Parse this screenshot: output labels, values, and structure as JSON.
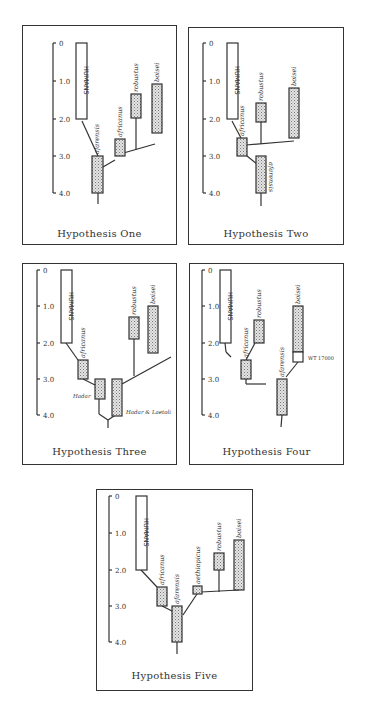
{
  "figure": {
    "axis_ticks": [
      "0",
      "1.0",
      "2.0",
      "3.0",
      "4.0"
    ],
    "axis_unit": "million years ago",
    "colors": {
      "line": "#333333",
      "fill_stipple": "#cfcfcf",
      "background": "#ffffff"
    }
  },
  "panels": [
    {
      "title": "Hypothesis One",
      "taxa": [
        {
          "label": "HUMANS",
          "start": 0,
          "end": 2.0,
          "fill": "open"
        },
        {
          "label": "afarensis",
          "start": 3.0,
          "end": 4.0,
          "fill": "stipple"
        },
        {
          "label": "africanus",
          "start": 2.6,
          "end": 3.0,
          "fill": "stipple"
        },
        {
          "label": "robustus",
          "start": 1.4,
          "end": 2.0,
          "fill": "stipple"
        },
        {
          "label": "boisei",
          "start": 1.1,
          "end": 2.4,
          "fill": "stipple"
        }
      ]
    },
    {
      "title": "Hypothesis Two",
      "taxa": [
        {
          "label": "HUMANS",
          "start": 0,
          "end": 2.0,
          "fill": "open"
        },
        {
          "label": "africanus",
          "start": 2.6,
          "end": 3.0,
          "fill": "stipple"
        },
        {
          "label": "robustus",
          "start": 1.6,
          "end": 2.1,
          "fill": "stipple"
        },
        {
          "label": "boisei",
          "start": 1.2,
          "end": 2.5,
          "fill": "stipple"
        },
        {
          "label": "afarensis",
          "start": 3.0,
          "end": 4.0,
          "fill": "stipple"
        }
      ]
    },
    {
      "title": "Hypothesis Three",
      "taxa": [
        {
          "label": "HUMANS",
          "start": 0,
          "end": 2.0,
          "fill": "open"
        },
        {
          "label": "africanus",
          "start": 2.5,
          "end": 3.0,
          "fill": "stipple"
        },
        {
          "label": "Hadar",
          "start": 3.0,
          "end": 3.5,
          "fill": "stipple"
        },
        {
          "label": "Hadar & Laetoli",
          "start": 3.0,
          "end": 4.0,
          "fill": "stipple"
        },
        {
          "label": "robustus",
          "start": 1.3,
          "end": 1.9,
          "fill": "stipple"
        },
        {
          "label": "boisei",
          "start": 1.0,
          "end": 2.3,
          "fill": "stipple"
        }
      ]
    },
    {
      "title": "Hypothesis Four",
      "taxa": [
        {
          "label": "HUMANS",
          "start": 0,
          "end": 2.0,
          "fill": "open"
        },
        {
          "label": "africanus",
          "start": 2.5,
          "end": 3.0,
          "fill": "stipple"
        },
        {
          "label": "robustus",
          "start": 1.4,
          "end": 2.0,
          "fill": "stipple"
        },
        {
          "label": "afarensis",
          "start": 3.0,
          "end": 4.0,
          "fill": "stipple"
        },
        {
          "label": "boisei",
          "start": 1.0,
          "end": 2.3,
          "fill": "stipple"
        },
        {
          "label": "WT 17000",
          "start": 2.3,
          "end": 2.6,
          "fill": "open"
        }
      ]
    },
    {
      "title": "Hypothesis Five",
      "taxa": [
        {
          "label": "HUMANS",
          "start": 0,
          "end": 2.0,
          "fill": "open"
        },
        {
          "label": "africanus",
          "start": 2.5,
          "end": 3.0,
          "fill": "stipple"
        },
        {
          "label": "afarensis",
          "start": 3.0,
          "end": 4.0,
          "fill": "stipple"
        },
        {
          "label": "aethiopicus",
          "start": 2.4,
          "end": 2.6,
          "fill": "stipple"
        },
        {
          "label": "robustus",
          "start": 1.5,
          "end": 2.0,
          "fill": "stipple"
        },
        {
          "label": "boisei",
          "start": 1.1,
          "end": 2.4,
          "fill": "stipple"
        }
      ]
    }
  ]
}
